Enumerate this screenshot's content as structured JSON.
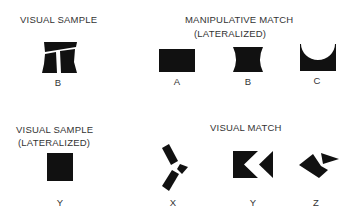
{
  "panels": {
    "top_left": {
      "title": "VISUAL SAMPLE",
      "items": [
        {
          "shape": "b-pedestal-split-shape",
          "label": "B"
        }
      ]
    },
    "top_right": {
      "title_line1": "MANIPULATIVE MATCH",
      "title_line2": "(LATERALIZED)",
      "items": [
        {
          "shape": "rectangle-shape",
          "label": "A"
        },
        {
          "shape": "concave-sides-shape",
          "label": "B"
        },
        {
          "shape": "square-with-semicircle-cutout-shape",
          "label": "C"
        }
      ]
    },
    "bottom_left": {
      "title_line1": "VISUAL SAMPLE",
      "title_line2": "(LATERALIZED)",
      "items": [
        {
          "shape": "square-shape",
          "label": "Y"
        }
      ]
    },
    "bottom_right": {
      "title": "VISUAL MATCH",
      "items": [
        {
          "shape": "scattered-fragments-shape",
          "label": "X"
        },
        {
          "shape": "square-with-chevron-cutout-shape",
          "label": "Y"
        },
        {
          "shape": "rotated-envelope-shape",
          "label": "Z"
        }
      ]
    }
  },
  "colors": {
    "shape_fill": "#111111",
    "text": "#333333",
    "background": "#ffffff"
  }
}
